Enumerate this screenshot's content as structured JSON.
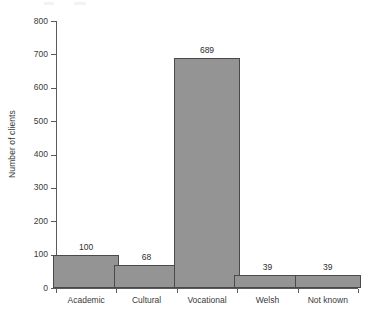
{
  "chart_data": {
    "type": "bar",
    "title": "",
    "subtitle": "",
    "xlabel": "",
    "ylabel": "Number of clients",
    "categories": [
      "Academic",
      "Cultural",
      "Vocational",
      "Welsh",
      "Not known"
    ],
    "values": [
      100,
      68,
      689,
      39,
      39
    ],
    "value_labels": [
      "100",
      "68",
      "689",
      "39",
      "39"
    ],
    "ylim": [
      0,
      800
    ],
    "ytick_values": [
      0,
      100,
      200,
      300,
      400,
      500,
      600,
      700,
      800
    ],
    "ytick_labels": [
      "0",
      "100",
      "200",
      "300",
      "400",
      "500",
      "600",
      "700",
      "800"
    ],
    "grid": false,
    "legend": null,
    "bar_fill_color": "#949494",
    "bar_edge_color": "#4a4a4a",
    "axis_color": "#5a5a5a",
    "text_color": "#3a3a3a",
    "background_color": "#ffffff"
  }
}
